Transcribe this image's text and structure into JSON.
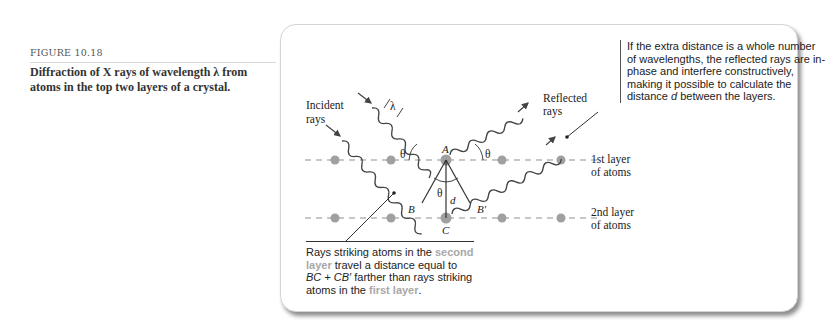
{
  "figure": {
    "number": "FIGURE 10.18",
    "caption": "Diffraction of X rays of wavelength λ from atoms in the top two layers of a crystal."
  },
  "diagram": {
    "labels": {
      "incident_rays": [
        "Incident",
        "rays"
      ],
      "reflected_rays": [
        "Reflected",
        "rays"
      ],
      "lambda": "λ",
      "theta": "θ",
      "point_a": "A",
      "point_b": "B",
      "point_b_prime": "B′",
      "point_c": "C",
      "distance_d": "d",
      "layer1": [
        "1st layer",
        "of atoms"
      ],
      "layer2": [
        "2nd layer",
        "of atoms"
      ]
    },
    "note_right": {
      "part1": "If the extra distance is a whole number of wavelengths, the reflected rays are in-phase and interfere constructively, making it possible to calculate the distance ",
      "var": "d",
      "part2": " between the layers."
    },
    "note_bottom": {
      "part1": "Rays striking atoms in the ",
      "hl1": "second layer",
      "part2": " travel a distance equal to ",
      "expr": "BC + CB′",
      "part3": " farther than rays striking atoms in the ",
      "hl2": "first layer",
      "part4": "."
    },
    "colors": {
      "atom": "#a0a0a0",
      "dashed_line": "#b5b5b5",
      "highlight_text": "#a8a8a8",
      "ray": "#444444"
    }
  }
}
